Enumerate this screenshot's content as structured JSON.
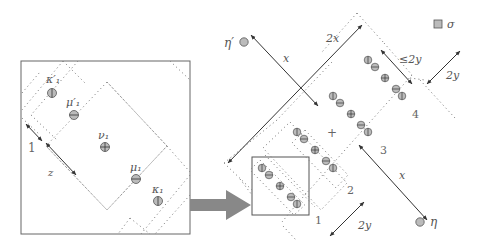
{
  "colors": {
    "line": "#555555",
    "dotted": "#888888",
    "node_fill": "#bbbbbb",
    "node_stroke": "#555555",
    "arrow": "#888888",
    "text": "#555555"
  },
  "left_panel": {
    "labels": {
      "kappa1_prime": "κ′₁",
      "mu1_prime": "μ′₁",
      "nu1": "ν₁",
      "mu1": "μ₁",
      "kappa1": "κ₁",
      "one": "1",
      "z": "z"
    },
    "nodes": [
      {
        "id": "kappa1_prime",
        "symbol": "vertical-bar"
      },
      {
        "id": "mu1_prime",
        "symbol": "minus"
      },
      {
        "id": "nu1",
        "symbol": "plus"
      },
      {
        "id": "mu1",
        "symbol": "minus"
      },
      {
        "id": "kappa1",
        "symbol": "vertical-bar"
      }
    ]
  },
  "right_panel": {
    "labels": {
      "eta_prime": "η′",
      "eta": "η",
      "sigma": "σ",
      "x_top": "x",
      "two_x": "2x",
      "le_two_y": "≤2y",
      "two_y_right": "2y",
      "x_bottom": "x",
      "two_y_bottom": "2y",
      "plus": "+",
      "region_1": "1",
      "region_2": "2",
      "region_3": "3",
      "region_4": "4"
    },
    "legend": {
      "symbol": "square",
      "label": "σ"
    }
  }
}
